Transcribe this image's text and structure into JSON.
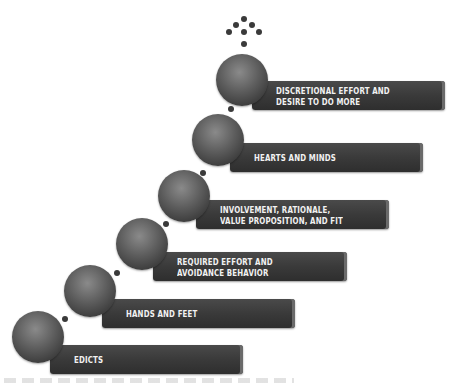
{
  "diagram": {
    "type": "staircase",
    "steps": [
      {
        "label": "EDICTS"
      },
      {
        "label": "HANDS AND FEET"
      },
      {
        "label": "REQUIRED EFFORT AND\nAVOIDANCE BEHAVIOR"
      },
      {
        "label": "INVOLVEMENT, RATIONALE,\nVALUE PROPOSITION, AND FIT"
      },
      {
        "label": "HEARTS AND MINDS"
      },
      {
        "label": "DISCRETIONAL EFFORT AND\nDESIRE TO DO MORE"
      }
    ],
    "colors": {
      "bar": "#3a3a3a",
      "ball": "#5c5c5c",
      "text": "#f2f2f2"
    }
  }
}
